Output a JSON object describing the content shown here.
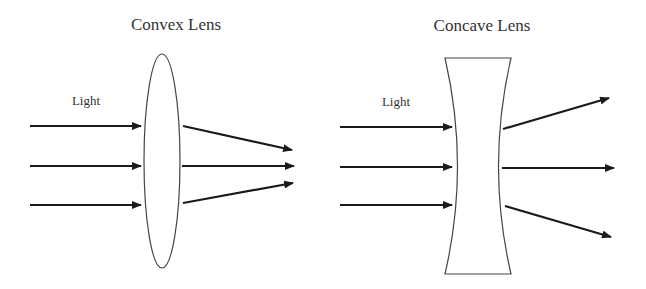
{
  "diagrams": [
    {
      "id": "convex",
      "title": "Convex Lens",
      "input_label": "Light",
      "lens_type": "converging",
      "incoming_rays": 3,
      "outgoing_rays": "converge"
    },
    {
      "id": "concave",
      "title": "Concave Lens",
      "input_label": "Light",
      "lens_type": "diverging",
      "incoming_rays": 3,
      "outgoing_rays": "diverge"
    }
  ],
  "colors": {
    "stroke": "#1a1a1a",
    "lens_outline": "#444444",
    "text": "#333333",
    "background": "#ffffff"
  }
}
